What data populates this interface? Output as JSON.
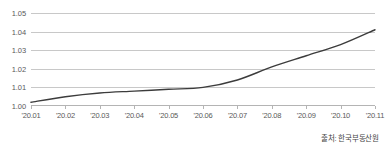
{
  "chart_data": {
    "type": "line",
    "title": "",
    "subtitle": "",
    "xlabel": "",
    "ylabel": "",
    "categories": [
      "'20.01",
      "'20.02",
      "'20.03",
      "'20.04",
      "'20.05",
      "'20.06",
      "'20.07",
      "'20.08",
      "'20.09",
      "'20.10",
      "'20.11"
    ],
    "values": [
      1.002,
      1.005,
      1.007,
      1.008,
      1.009,
      1.01,
      1.014,
      1.021,
      1.027,
      1.033,
      1.041
    ],
    "series": [
      {
        "name": "index",
        "values": [
          1.002,
          1.005,
          1.007,
          1.008,
          1.009,
          1.01,
          1.014,
          1.021,
          1.027,
          1.033,
          1.041
        ]
      }
    ],
    "ylim": [
      1.0,
      1.05
    ],
    "yticks": [
      "1.00",
      "1.01",
      "1.02",
      "1.03",
      "1.04",
      "1.05"
    ],
    "ytick_values": [
      1.0,
      1.01,
      1.02,
      1.03,
      1.04,
      1.05
    ],
    "grid": true,
    "legend": false,
    "legend_position": "none",
    "line_color": "#3c3c3c",
    "grid_color": "#c8c8c8",
    "background_color": "#ffffff"
  },
  "annotations": {
    "source_note": "출처: 한국부동산원"
  }
}
